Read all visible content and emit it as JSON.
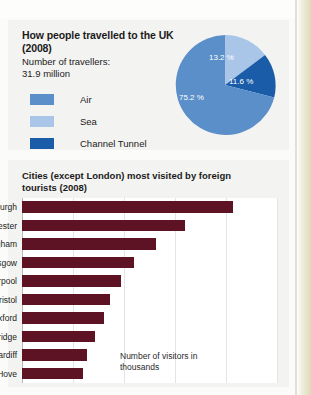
{
  "pie_panel": {
    "title": "How people travelled to the UK (2008)",
    "subtitle": "Number of travellers:\n31.9 million",
    "legend": [
      {
        "label": "Air",
        "color": "#5b8fc9",
        "icon": "legend-swatch-air"
      },
      {
        "label": "Sea",
        "color": "#a9c6e8",
        "icon": "legend-swatch-sea"
      },
      {
        "label": "Channel Tunnel",
        "color": "#1a5ca8",
        "icon": "legend-swatch-channel-tunnel"
      }
    ],
    "labels": {
      "sea_pct": "13.2 %",
      "tunnel_pct": "11.6 %",
      "air_pct": "75.2 %"
    }
  },
  "bar_panel": {
    "title": "Cities (except London) most visited by foreign tourists (2008)",
    "axis_caption": "Number of visitors in thousands"
  },
  "chart_data": [
    {
      "type": "pie",
      "title": "How people travelled to the UK (2008)",
      "subtitle": "Number of travellers: 31.9 million",
      "unit": "percent",
      "legend_position": "left",
      "total_travellers_millions": 31.9,
      "slices": [
        {
          "name": "Air",
          "value": 75.2,
          "label": "75.2 %",
          "color": "#5b8fc9"
        },
        {
          "name": "Sea",
          "value": 13.2,
          "label": "13.2 %",
          "color": "#a9c6e8"
        },
        {
          "name": "Channel Tunnel",
          "value": 11.6,
          "label": "11.6 %",
          "color": "#1a5ca8"
        }
      ]
    },
    {
      "type": "bar",
      "orientation": "horizontal",
      "title": "Cities (except London) most visited by foreign tourists (2008)",
      "xlabel": "Number of visitors in thousands",
      "ylabel": "",
      "grid": true,
      "xlim": [
        0,
        1500
      ],
      "bar_color": "#5e1324",
      "categories": [
        "Edinburgh",
        "Manchester",
        "Birmingham",
        "Glasgow",
        "Liverpool",
        "Bristol",
        "Oxford",
        "Cambridge",
        "Cardiff",
        "Brighton/Hove"
      ],
      "values": [
        1240,
        960,
        790,
        660,
        580,
        520,
        480,
        430,
        380,
        360
      ]
    }
  ]
}
